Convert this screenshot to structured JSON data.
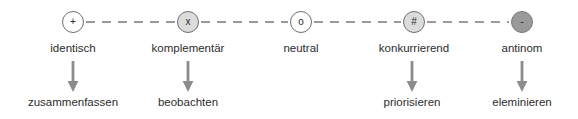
{
  "diagram": {
    "colors": {
      "node_outline": "#6e6e6e",
      "node_fill_none": "#ffffff",
      "node_fill_light": "#dcdcdc",
      "node_fill_dark": "#9a9a9a",
      "connector": "#9a9a9a",
      "arrow": "#8c8c8c",
      "text": "#2d2d2d"
    },
    "nodes": [
      {
        "glyph": "+",
        "icon": "plus-symbol",
        "fill": "fill-none",
        "cx": 73,
        "label": "identisch",
        "action": "zusammenfassen",
        "has_arrow": true
      },
      {
        "glyph": "x",
        "icon": "cross-symbol",
        "fill": "fill-light",
        "cx": 188,
        "label": "komplementär",
        "action": "beobachten",
        "has_arrow": true
      },
      {
        "glyph": "o",
        "icon": "circle-symbol",
        "fill": "fill-none",
        "cx": 301,
        "label": "neutral",
        "action": "",
        "has_arrow": false
      },
      {
        "glyph": "#",
        "icon": "hash-symbol",
        "fill": "fill-light",
        "cx": 414,
        "label": "konkurrierend",
        "action": "priorisieren",
        "has_arrow": true
      },
      {
        "glyph": "-",
        "icon": "minus-symbol",
        "fill": "fill-dark",
        "cx": 522,
        "label": "antinom",
        "action": "eleminieren",
        "has_arrow": true
      }
    ],
    "connectors": [
      {
        "from": "identisch",
        "to": "komplementär",
        "style": "dashed"
      },
      {
        "from": "komplementär",
        "to": "neutral",
        "style": "dashed"
      },
      {
        "from": "neutral",
        "to": "konkurrierend",
        "style": "dashed"
      },
      {
        "from": "konkurrierend",
        "to": "antinom",
        "style": "dashed"
      }
    ]
  }
}
